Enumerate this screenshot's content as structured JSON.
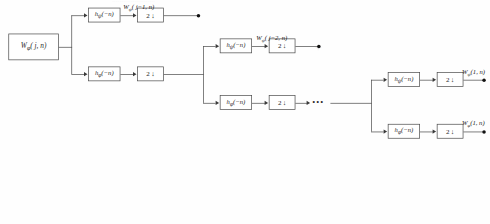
{
  "figure": {
    "type": "wavelet-analysis-filter-bank",
    "background_color": "#fefefe",
    "line_color": "#4a4a4a",
    "text_color": "#1b1b1b"
  },
  "source": {
    "label": "W",
    "sub": "φ",
    "args": "( j, n)"
  },
  "stage1": {
    "highpass_filter": {
      "label": "h",
      "sub": "ψ",
      "args": "(−n)"
    },
    "highpass_down": {
      "factor": "2",
      "arrow": "↓"
    },
    "highpass_output": {
      "label": "W",
      "sub": "ψ",
      "args": "( j−1, n)"
    },
    "lowpass_filter": {
      "label": "h",
      "sub": "φ",
      "args": "(−n)"
    },
    "lowpass_down": {
      "factor": "2",
      "arrow": "↓"
    }
  },
  "stage2": {
    "highpass_filter": {
      "label": "h",
      "sub": "ψ",
      "args": "(−n)"
    },
    "highpass_down": {
      "factor": "2",
      "arrow": "↓"
    },
    "highpass_output": {
      "label": "W",
      "sub": "ψ",
      "args": "( j−2, n)"
    },
    "lowpass_filter": {
      "label": "h",
      "sub": "φ",
      "args": "(−n)"
    },
    "lowpass_down": {
      "factor": "2",
      "arrow": "↓"
    },
    "continuation": "•••"
  },
  "stage3": {
    "highpass_filter": {
      "label": "h",
      "sub": "ψ",
      "args": "(−n)"
    },
    "highpass_down": {
      "factor": "2",
      "arrow": "↓"
    },
    "highpass_output": {
      "label": "W",
      "sub": "ψ",
      "args": "(1, n)"
    },
    "lowpass_filter": {
      "label": "h",
      "sub": "φ",
      "args": "(−n)"
    },
    "lowpass_down": {
      "factor": "2",
      "arrow": "↓"
    },
    "lowpass_output": {
      "label": "W",
      "sub": "φ",
      "args": "(1, n)"
    }
  }
}
